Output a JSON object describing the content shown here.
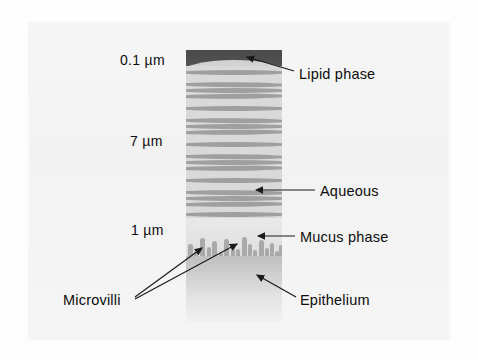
{
  "figure": {
    "background_color": "#fdfdfd",
    "panel_color": "#f4f4f4"
  },
  "scale_labels": [
    {
      "id": "lipid-thickness",
      "text": "0.1 µm",
      "x": 120,
      "y": 52
    },
    {
      "id": "aqueous-thickness",
      "text": "7 µm",
      "x": 130,
      "y": 133
    },
    {
      "id": "mucus-thickness",
      "text": "1 µm",
      "x": 131,
      "y": 222
    }
  ],
  "callouts": [
    {
      "id": "lipid-phase",
      "text": "Lipid phase",
      "x": 299,
      "y": 66,
      "tip_x": 242,
      "tip_y": 58,
      "elbow_x": 292,
      "elbow_y": 74
    },
    {
      "id": "aqueous",
      "text": "Aqueous",
      "x": 320,
      "y": 183,
      "tip_x": 252,
      "tip_y": 190,
      "elbow_x": 312,
      "elbow_y": 190
    },
    {
      "id": "mucus-phase",
      "text": "Mucus phase",
      "x": 300,
      "y": 229,
      "tip_x": 254,
      "tip_y": 236,
      "elbow_x": 293,
      "elbow_y": 236
    },
    {
      "id": "epithelium",
      "text": "Epithelium",
      "x": 300,
      "y": 292,
      "tip_x": 253,
      "tip_y": 272,
      "elbow_x": 293,
      "elbow_y": 299
    },
    {
      "id": "microvilli",
      "text": "Microvilli",
      "x": 63,
      "y": 292,
      "tip_x": 205,
      "tip_y": 244,
      "elbow_x": 136,
      "elbow_y": 299
    }
  ],
  "microvilli_second_tip": {
    "tip_x": 240,
    "tip_y": 240
  },
  "layers": {
    "lipid": {
      "name": "Lipid phase",
      "thickness": "0.1 µm",
      "color": "#4a4a4a",
      "order": 1
    },
    "aqueous": {
      "name": "Aqueous",
      "thickness": "7 µm",
      "color": "#d9d9d9",
      "wave_color": "#9a9a9a",
      "wave_count": 17,
      "order": 2
    },
    "mucus": {
      "name": "Mucus phase",
      "thickness": "1 µm",
      "color": "#e2e2e2",
      "villi_color": "#a9a9a9",
      "villi_count": 17,
      "order": 3
    },
    "epithelium": {
      "name": "Epithelium",
      "thickness": "",
      "color": "#cfcfcf",
      "order": 4
    }
  },
  "waves": [
    {
      "top": 4,
      "phase": 0
    },
    {
      "top": 13,
      "phase": 1
    },
    {
      "top": 22,
      "phase": 2
    },
    {
      "top": 31,
      "phase": 3
    },
    {
      "top": 40,
      "phase": 0
    },
    {
      "top": 49,
      "phase": 1
    },
    {
      "top": 58,
      "phase": 2
    },
    {
      "top": 67,
      "phase": 3
    },
    {
      "top": 76,
      "phase": 0
    },
    {
      "top": 85,
      "phase": 1
    },
    {
      "top": 94,
      "phase": 2
    },
    {
      "top": 103,
      "phase": 3
    },
    {
      "top": 112,
      "phase": 0
    },
    {
      "top": 121,
      "phase": 1
    },
    {
      "top": 130,
      "phase": 2
    },
    {
      "top": 139,
      "phase": 3
    },
    {
      "top": 146,
      "phase": 0
    }
  ],
  "villi": [
    {
      "left": 2,
      "height": 20,
      "width": 5
    },
    {
      "left": 8,
      "height": 13,
      "width": 4
    },
    {
      "left": 14,
      "height": 26,
      "width": 5
    },
    {
      "left": 21,
      "height": 17,
      "width": 4
    },
    {
      "left": 26,
      "height": 23,
      "width": 5
    },
    {
      "left": 33,
      "height": 12,
      "width": 4
    },
    {
      "left": 38,
      "height": 25,
      "width": 5
    },
    {
      "left": 45,
      "height": 18,
      "width": 4
    },
    {
      "left": 50,
      "height": 15,
      "width": 4
    },
    {
      "left": 56,
      "height": 27,
      "width": 5
    },
    {
      "left": 62,
      "height": 20,
      "width": 4
    },
    {
      "left": 67,
      "height": 14,
      "width": 4
    },
    {
      "left": 73,
      "height": 24,
      "width": 5
    },
    {
      "left": 79,
      "height": 16,
      "width": 4
    },
    {
      "left": 84,
      "height": 21,
      "width": 4
    },
    {
      "left": 89,
      "height": 13,
      "width": 4
    },
    {
      "left": 93,
      "height": 19,
      "width": 4
    }
  ]
}
